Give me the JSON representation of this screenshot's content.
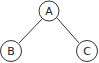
{
  "diagram": {
    "type": "tree",
    "nodes": [
      {
        "id": "A",
        "label": "A",
        "cx": 49,
        "cy": 11,
        "r": 10
      },
      {
        "id": "B",
        "label": "B",
        "cx": 11,
        "cy": 51,
        "r": 10.5
      },
      {
        "id": "C",
        "label": "C",
        "cx": 87,
        "cy": 51,
        "r": 10.5
      }
    ],
    "edges": [
      {
        "from": "A",
        "to": "B"
      },
      {
        "from": "A",
        "to": "C"
      }
    ],
    "colors": {
      "stroke": "#333333",
      "fill": "#ffffff",
      "text": "#222222"
    }
  }
}
